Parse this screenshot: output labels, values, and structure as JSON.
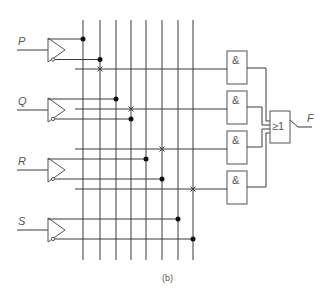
{
  "inputs": [
    {
      "label": "P",
      "y": 50
    },
    {
      "label": "Q",
      "y": 110
    },
    {
      "label": "R",
      "y": 170
    },
    {
      "label": "S",
      "y": 230
    }
  ],
  "bus_lines_x": [
    83,
    100,
    116,
    131,
    146,
    162,
    178,
    193
  ],
  "and_gates": [
    {
      "label": "&",
      "y": 51
    },
    {
      "label": "&",
      "y": 91
    },
    {
      "label": "&",
      "y": 131
    },
    {
      "label": "&",
      "y": 171
    }
  ],
  "or_gate": {
    "label": "≥1"
  },
  "output": {
    "label": "F"
  },
  "caption": "(b)"
}
